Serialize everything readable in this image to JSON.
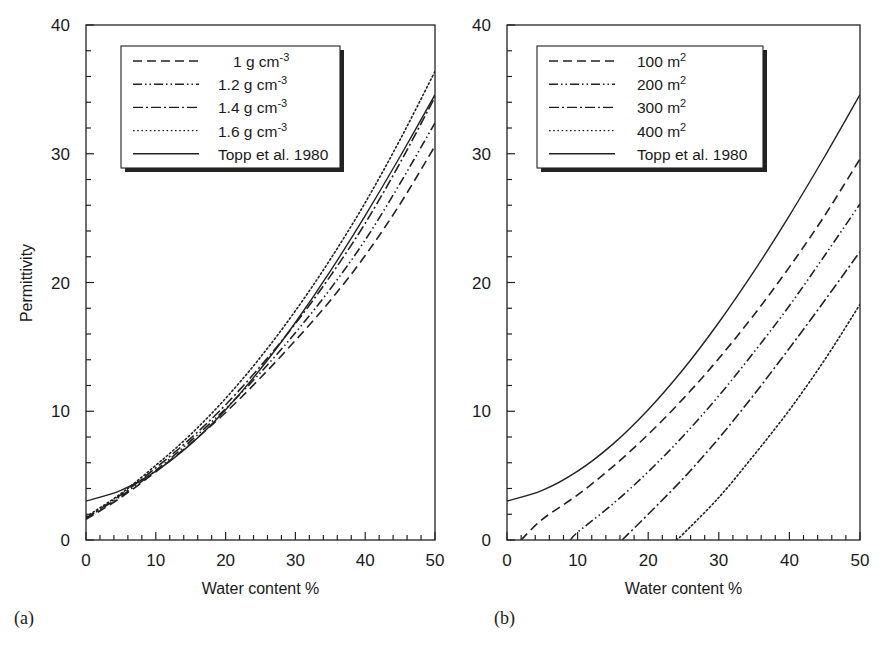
{
  "figure": {
    "panels": [
      {
        "id": "a",
        "tag": "(a)",
        "ylabel": "Permittivity",
        "xlabel": "Water content %",
        "legend": [
          {
            "label": "1 g cm",
            "sup": "-3",
            "style": "dashed"
          },
          {
            "label": "1.2 g cm",
            "sup": "-3",
            "style": "dash-dot-dot"
          },
          {
            "label": "1.4 g cm",
            "sup": "-3",
            "style": "dash-dot"
          },
          {
            "label": "1.6 g cm",
            "sup": "-3",
            "style": "dotted"
          },
          {
            "label": "Topp et al. 1980",
            "sup": "",
            "style": "solid"
          }
        ]
      },
      {
        "id": "b",
        "tag": "(b)",
        "ylabel": "",
        "xlabel": "Water content %",
        "legend": [
          {
            "label": "100 m",
            "sup": "2",
            "style": "dashed"
          },
          {
            "label": "200 m",
            "sup": "2",
            "style": "dash-dot-dot"
          },
          {
            "label": "300 m",
            "sup": "2",
            "style": "dash-dot"
          },
          {
            "label": "400 m",
            "sup": "2",
            "style": "dotted"
          },
          {
            "label": "Topp et al. 1980",
            "sup": "",
            "style": "solid"
          }
        ]
      }
    ],
    "xticks": [
      "0",
      "10",
      "20",
      "30",
      "40",
      "50"
    ],
    "yticks": [
      "0",
      "10",
      "20",
      "30",
      "40"
    ]
  },
  "chart_data": [
    {
      "type": "line",
      "title": "(a)",
      "xlabel": "Water content %",
      "ylabel": "Permittivity",
      "xlim": [
        0,
        50
      ],
      "ylim": [
        0,
        40
      ],
      "xticks": [
        0,
        10,
        20,
        30,
        40,
        50
      ],
      "yticks": [
        0,
        10,
        20,
        30,
        40
      ],
      "grid": false,
      "legend_position": "upper left (inset)",
      "x": [
        0,
        5,
        10,
        15,
        20,
        25,
        30,
        35,
        40,
        45,
        50
      ],
      "series": [
        {
          "name": "1 g cm-3",
          "style": "dashed",
          "values": [
            1.6,
            3.3,
            5.3,
            7.5,
            9.9,
            12.6,
            15.5,
            18.6,
            22.1,
            26.1,
            30.6
          ]
        },
        {
          "name": "1.2 g cm-3",
          "style": "dash-dot-dot",
          "values": [
            1.7,
            3.4,
            5.4,
            7.7,
            10.2,
            13.0,
            16.1,
            19.5,
            23.3,
            27.7,
            32.4
          ]
        },
        {
          "name": "1.4 g cm-3",
          "style": "dash-dot",
          "values": [
            1.7,
            3.5,
            5.6,
            7.9,
            10.5,
            13.5,
            16.8,
            20.5,
            24.6,
            29.3,
            34.4
          ]
        },
        {
          "name": "1.6 g cm-3",
          "style": "dotted",
          "values": [
            1.8,
            3.6,
            5.8,
            8.2,
            11.0,
            14.2,
            17.8,
            21.8,
            26.2,
            31.1,
            36.4
          ]
        },
        {
          "name": "Topp et al. 1980",
          "style": "solid",
          "values": [
            3.03,
            3.85,
            5.34,
            7.45,
            10.12,
            13.28,
            16.89,
            20.88,
            25.2,
            29.79,
            34.59
          ]
        }
      ]
    },
    {
      "type": "line",
      "title": "(b)",
      "xlabel": "Water content %",
      "ylabel": "",
      "xlim": [
        0,
        50
      ],
      "ylim": [
        0,
        40
      ],
      "xticks": [
        0,
        10,
        20,
        30,
        40,
        50
      ],
      "yticks": [
        0,
        10,
        20,
        30,
        40
      ],
      "grid": false,
      "legend_position": "upper left (inset)",
      "x": [
        0,
        5,
        10,
        15,
        20,
        25,
        30,
        35,
        40,
        45,
        50
      ],
      "series": [
        {
          "name": "100 m2",
          "style": "dashed",
          "values": [
            null,
            1.6,
            3.5,
            5.7,
            8.2,
            11.0,
            14.1,
            17.5,
            21.2,
            25.2,
            29.6
          ]
        },
        {
          "name": "200 m2",
          "style": "dash-dot-dot",
          "values": [
            null,
            null,
            0.6,
            2.8,
            5.3,
            8.1,
            11.2,
            14.6,
            18.2,
            22.1,
            26.1
          ]
        },
        {
          "name": "300 m2",
          "style": "dash-dot",
          "values": [
            null,
            null,
            null,
            null,
            2.0,
            4.8,
            7.9,
            11.3,
            14.9,
            18.6,
            22.4
          ]
        },
        {
          "name": "400 m2",
          "style": "dotted",
          "values": [
            null,
            null,
            null,
            null,
            null,
            0.5,
            3.3,
            6.6,
            10.1,
            14.0,
            18.3
          ]
        },
        {
          "name": "Topp et al. 1980",
          "style": "solid",
          "values": [
            3.03,
            3.85,
            5.34,
            7.45,
            10.12,
            13.28,
            16.89,
            20.88,
            25.2,
            29.79,
            34.59
          ]
        }
      ],
      "x_intercepts": {
        "100 m2": 2,
        "200 m2": 9,
        "300 m2": 16.3,
        "400 m2": 24
      }
    }
  ]
}
